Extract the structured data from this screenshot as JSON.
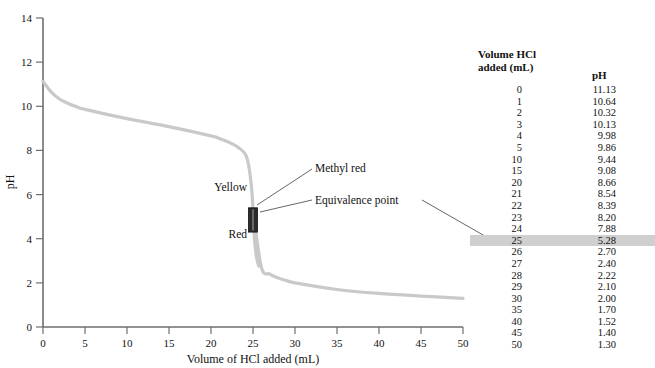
{
  "chart_data": {
    "type": "line",
    "title": "",
    "xlabel": "Volume of HCl added (mL)",
    "ylabel": "pH",
    "xlim": [
      0,
      50
    ],
    "ylim": [
      0,
      14
    ],
    "xticks": [
      0,
      5,
      10,
      15,
      20,
      25,
      30,
      35,
      40,
      45,
      50
    ],
    "yticks": [
      0,
      2,
      4,
      6,
      8,
      10,
      12,
      14
    ],
    "grid": false,
    "legend": "none",
    "series_name": "Titration curve of weak base with HCl",
    "curve_color": "#c9c9c9",
    "x": [
      0,
      1,
      2,
      3,
      4,
      5,
      10,
      15,
      20,
      21,
      22,
      23,
      24,
      25,
      26,
      27,
      28,
      29,
      30,
      35,
      40,
      45,
      50
    ],
    "y": [
      11.13,
      10.64,
      10.32,
      10.13,
      9.98,
      9.86,
      9.44,
      9.08,
      8.66,
      8.54,
      8.39,
      8.2,
      7.88,
      5.28,
      2.7,
      2.4,
      2.22,
      2.1,
      2.0,
      1.7,
      1.52,
      1.4,
      1.3
    ],
    "annotations": [
      {
        "name": "methyl-red",
        "text": "Methyl red",
        "x": 25,
        "y": 5.9
      },
      {
        "name": "equivalence-point",
        "text": "Equivalence point",
        "x": 25,
        "y": 5.28
      },
      {
        "name": "indicator-yellow",
        "text": "Yellow",
        "x": 22.5,
        "y": 6.2
      },
      {
        "name": "indicator-red",
        "text": "Red",
        "x": 22.5,
        "y": 4.0
      }
    ],
    "indicator_marker": {
      "name": "methyl-red-range",
      "label": "Methyl red transition range",
      "x": 25,
      "ph_low": 4.3,
      "ph_high": 5.4,
      "color": "#2b2b2b"
    }
  },
  "axes": {
    "y_tick_labels": [
      "14",
      "12",
      "10",
      "8",
      "6",
      "4",
      "2",
      "0"
    ],
    "x_tick_labels": [
      "0",
      "5",
      "10",
      "15",
      "20",
      "25",
      "30",
      "35",
      "40",
      "45",
      "50"
    ],
    "y_title": "pH",
    "x_title": "Volume of HCl added (mL)"
  },
  "annotations": {
    "methyl_red": "Methyl red",
    "equivalence_point": "Equivalence point",
    "yellow": "Yellow",
    "red": "Red"
  },
  "table": {
    "header_volume": "Volume HCl added (mL)",
    "header_volume_line1": "Volume HCl",
    "header_volume_line2": "added (mL)",
    "header_ph": "pH",
    "highlight_row_index": 13,
    "rows": [
      {
        "volume": "0",
        "ph": "11.13"
      },
      {
        "volume": "1",
        "ph": "10.64"
      },
      {
        "volume": "2",
        "ph": "10.32"
      },
      {
        "volume": "3",
        "ph": "10.13"
      },
      {
        "volume": "4",
        "ph": "9.98"
      },
      {
        "volume": "5",
        "ph": "9.86"
      },
      {
        "volume": "10",
        "ph": "9.44"
      },
      {
        "volume": "15",
        "ph": "9.08"
      },
      {
        "volume": "20",
        "ph": "8.66"
      },
      {
        "volume": "21",
        "ph": "8.54"
      },
      {
        "volume": "22",
        "ph": "8.39"
      },
      {
        "volume": "23",
        "ph": "8.20"
      },
      {
        "volume": "24",
        "ph": "7.88"
      },
      {
        "volume": "25",
        "ph": "5.28"
      },
      {
        "volume": "26",
        "ph": "2.70"
      },
      {
        "volume": "27",
        "ph": "2.40"
      },
      {
        "volume": "28",
        "ph": "2.22"
      },
      {
        "volume": "29",
        "ph": "2.10"
      },
      {
        "volume": "30",
        "ph": "2.00"
      },
      {
        "volume": "35",
        "ph": "1.70"
      },
      {
        "volume": "40",
        "ph": "1.52"
      },
      {
        "volume": "45",
        "ph": "1.40"
      },
      {
        "volume": "50",
        "ph": "1.30"
      }
    ]
  },
  "colors": {
    "curve": "#c9c9c9",
    "axis": "#6e6e6e",
    "highlight": "#cfcfcf",
    "marker": "#2b2b2b",
    "leader": "#555555"
  }
}
